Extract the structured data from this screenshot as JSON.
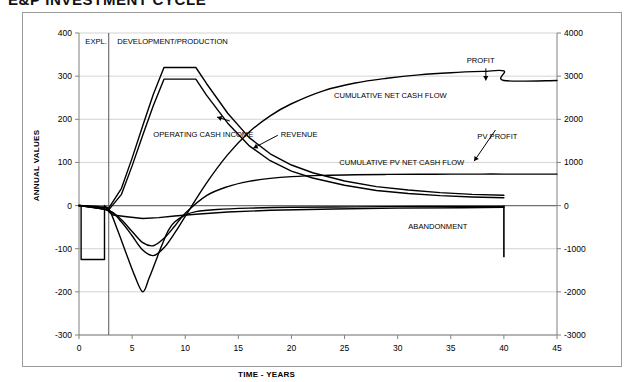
{
  "chart_title": "E&P INVESTMENT CYCLE",
  "chart_data": {
    "type": "line",
    "title": "E&P INVESTMENT CYCLE",
    "xlabel": "TIME - YEARS",
    "ylabel": "ANNUAL VALUES",
    "ylabel_right": "CUMULATIVE NET CASH FLOW",
    "xlim": [
      0,
      45
    ],
    "ylim": [
      -300,
      400
    ],
    "ylim_right": [
      -3000,
      4000
    ],
    "xticks": [
      0,
      5,
      10,
      15,
      20,
      25,
      30,
      35,
      40,
      45
    ],
    "yticks": [
      -300,
      -200,
      -100,
      0,
      100,
      200,
      300,
      400
    ],
    "yticks_right": [
      -3000,
      -2000,
      -1000,
      0,
      1000,
      2000,
      3000,
      4000
    ],
    "grid": true,
    "legend": "none (inline annotations)",
    "line_color": "#000000",
    "grid_color": "#c8c8c8",
    "axis_color": "#808080",
    "phase_divider_x": 2.8,
    "abandonment_x": 40,
    "abandonment_depth": -120,
    "series": [
      {
        "name": "REVENUE",
        "axis": "left",
        "x": [
          0,
          1.5,
          2.8,
          4,
          5,
          6,
          7,
          8,
          9,
          10,
          11,
          12,
          14,
          16,
          18,
          20,
          22,
          25,
          28,
          31,
          34,
          37,
          40
        ],
        "values": [
          0,
          -3,
          -6,
          40,
          110,
          185,
          258,
          320,
          320,
          320,
          320,
          283,
          214,
          158,
          120,
          94,
          76,
          57,
          44,
          36,
          30,
          26,
          24
        ]
      },
      {
        "name": "OPERATING CASH INCOME",
        "axis": "left",
        "x": [
          0,
          1.5,
          2.8,
          4,
          5,
          6,
          7,
          8,
          9,
          10,
          11,
          12,
          14,
          16,
          18,
          20,
          22,
          25,
          28,
          31,
          34,
          37,
          40
        ],
        "values": [
          0,
          -5,
          -10,
          26,
          92,
          163,
          232,
          293,
          293,
          293,
          293,
          256,
          191,
          139,
          104,
          80,
          64,
          47,
          35,
          28,
          23,
          20,
          18
        ]
      },
      {
        "name": "EXPLORATION SPEND",
        "axis": "left",
        "x": [
          0,
          0.2,
          0.2,
          2.4,
          2.4,
          2.8,
          3.2,
          4.5,
          6,
          7.5,
          9,
          11,
          14,
          18,
          24,
          30,
          36,
          40
        ],
        "values": [
          0,
          0,
          -125,
          -125,
          0,
          -14,
          -22,
          -26,
          -30,
          -28,
          -24,
          -20,
          -15,
          -11,
          -8,
          -6,
          -5,
          -4
        ]
      },
      {
        "name": "DEVELOPMENT CAPITAL",
        "axis": "left",
        "x": [
          0,
          2.0,
          2.8,
          3.6,
          4.4,
          5.2,
          6.0,
          6.6,
          7.2,
          7.8,
          8.4,
          9.0,
          10,
          11,
          13,
          16,
          20,
          26,
          32,
          38,
          40
        ],
        "values": [
          0,
          -3,
          -8,
          -55,
          -108,
          -160,
          -200,
          -168,
          -130,
          -92,
          -58,
          -38,
          -22,
          -14,
          -9,
          -6,
          -4,
          -3,
          -2,
          -2,
          -2
        ]
      },
      {
        "name": "CUMULATIVE NET CASH FLOW",
        "axis": "right",
        "x": [
          0,
          2.8,
          4,
          5,
          6,
          7,
          8,
          9,
          10,
          12,
          14,
          16,
          18,
          20,
          23,
          26,
          29,
          32,
          35,
          38,
          40,
          40,
          45
        ],
        "values": [
          0,
          -120,
          -380,
          -700,
          -1030,
          -1160,
          -980,
          -640,
          -250,
          520,
          1180,
          1700,
          2080,
          2360,
          2660,
          2840,
          2950,
          3030,
          3080,
          3110,
          3120,
          2900,
          2900
        ]
      },
      {
        "name": "CUMULATIVE PV NET CASH FLOW",
        "axis": "right",
        "x": [
          0,
          2.8,
          4,
          5,
          6,
          7,
          8,
          9,
          10,
          12,
          14,
          16,
          18,
          20,
          23,
          26,
          29,
          32,
          35,
          38,
          40,
          45
        ],
        "values": [
          0,
          -110,
          -330,
          -600,
          -860,
          -930,
          -760,
          -480,
          -180,
          230,
          440,
          560,
          630,
          670,
          700,
          715,
          722,
          726,
          728,
          730,
          730,
          730
        ]
      }
    ],
    "annotations": [
      {
        "text": "EXPL.",
        "x": 0.6,
        "y": 375
      },
      {
        "text": "DEVELOPMENT/PRODUCTION",
        "x": 3.6,
        "y": 375
      },
      {
        "text": "OPERATING CASH INCOME",
        "x": 7.0,
        "y": 160
      },
      {
        "text": "REVENUE",
        "x": 19.0,
        "y": 160
      },
      {
        "text": "CUMULATIVE NET CASH FLOW",
        "x": 24.0,
        "y": 250
      },
      {
        "text": "CUMULATIVE PV NET CASH FLOW",
        "x": 24.5,
        "y": 95
      },
      {
        "text": "PROFIT",
        "x": 36.5,
        "y": 330
      },
      {
        "text": "PV PROFIT",
        "x": 37.5,
        "y": 155
      },
      {
        "text": "ABANDONMENT",
        "x": 31.0,
        "y": -55
      }
    ]
  }
}
